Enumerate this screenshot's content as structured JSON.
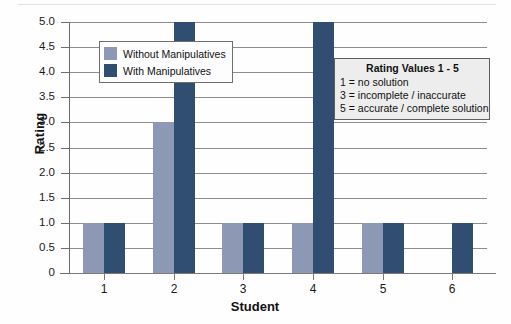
{
  "chart_data": {
    "type": "bar",
    "title": "",
    "xlabel": "Student",
    "ylabel": "Rating",
    "categories": [
      "1",
      "2",
      "3",
      "4",
      "5",
      "6"
    ],
    "series": [
      {
        "name": "Without Manipulatives",
        "color": "#8d99b4",
        "values": [
          1,
          3,
          1,
          1,
          1,
          0
        ]
      },
      {
        "name": "With Manipulatives",
        "color": "#2f4e72",
        "values": [
          1,
          5,
          1,
          5,
          1,
          1
        ]
      }
    ],
    "ylim": [
      0,
      5
    ],
    "yticks": [
      "0",
      "0.5",
      "1.0",
      "1.5",
      "2.0",
      "2.5",
      "3.0",
      "3.5",
      "4.0",
      "4.5",
      "5.0"
    ],
    "ytick_values": [
      0,
      0.5,
      1.0,
      1.5,
      2.0,
      2.5,
      3.0,
      3.5,
      4.0,
      4.5,
      5.0
    ],
    "grid": true,
    "legend_position": "upper-left-inside"
  },
  "legend": {
    "items": [
      {
        "label": "Without Manipulatives",
        "swatch": "#8d99b4"
      },
      {
        "label": "With Manipulatives",
        "swatch": "#2f4e72"
      }
    ]
  },
  "rating_box": {
    "title": "Rating Values 1 - 5",
    "lines": [
      "1 = no solution",
      "3 = incomplete / inaccurate",
      "5 = accurate / complete solution"
    ]
  },
  "axes": {
    "y_title": "Rating",
    "x_title": "Student",
    "y_labels": [
      "5.0",
      "4.5",
      "4.0",
      "3.5",
      "3.0",
      "2.5",
      "2.0",
      "1.5",
      "1.0",
      "0.5",
      "0"
    ],
    "x_labels": [
      "1",
      "2",
      "3",
      "4",
      "5",
      "6"
    ]
  }
}
